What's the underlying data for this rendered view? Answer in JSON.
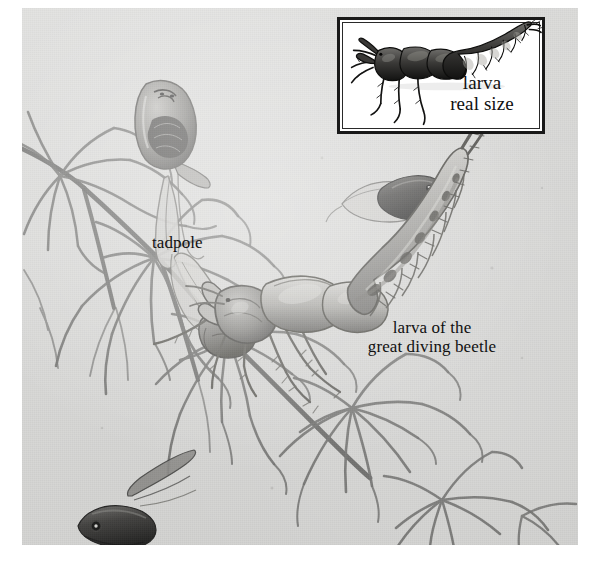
{
  "illustration": {
    "title": "larva of the great diving beetle attacking tadpoles among aquatic plants",
    "background_color": "#d9d9d7",
    "ink_color": "#3a3a3a",
    "page_color": "#ffffff"
  },
  "inset": {
    "name": "real-size-inset",
    "border_color": "#191919",
    "background_color": "#ffffff",
    "caption_line1": "larva",
    "caption_line2": "real size",
    "caption": "larva\nreal size"
  },
  "labels": {
    "tadpole": "tadpole",
    "larva": "larva of the\ngreat diving beetle",
    "larva_line1": "larva of the",
    "larva_line2": "great diving beetle"
  },
  "subjects": [
    {
      "name": "tadpole-upper",
      "label": "tadpole"
    },
    {
      "name": "tadpole-middle",
      "label": "tadpole"
    },
    {
      "name": "tadpole-lower-left",
      "label": "tadpole"
    },
    {
      "name": "tadpole-captured",
      "label": "tadpole"
    },
    {
      "name": "beetle-larva-main",
      "label": "larva of the great diving beetle"
    },
    {
      "name": "beetle-larva-inset",
      "label": "larva real size"
    },
    {
      "name": "aquatic-plant",
      "label": "aquatic plant"
    }
  ]
}
